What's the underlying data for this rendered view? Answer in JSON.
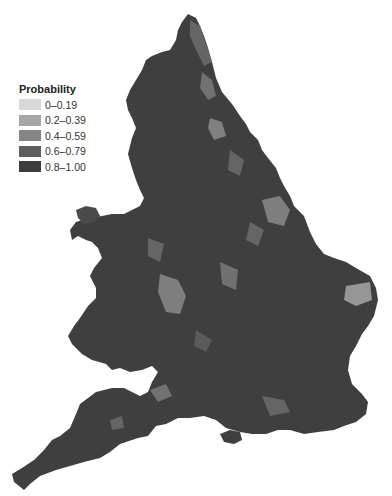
{
  "legend": {
    "title": "Probability",
    "items": [
      {
        "label": "0–0.19",
        "color": "#d9d9d9"
      },
      {
        "label": "0.2–0.39",
        "color": "#a6a6a6"
      },
      {
        "label": "0.4–0.59",
        "color": "#858585"
      },
      {
        "label": "0.6–0.79",
        "color": "#5e5e5e"
      },
      {
        "label": "0.8–1.00",
        "color": "#3d3d3d"
      }
    ]
  },
  "map": {
    "region": "England and Wales",
    "base_color": "#3f3f3f"
  }
}
